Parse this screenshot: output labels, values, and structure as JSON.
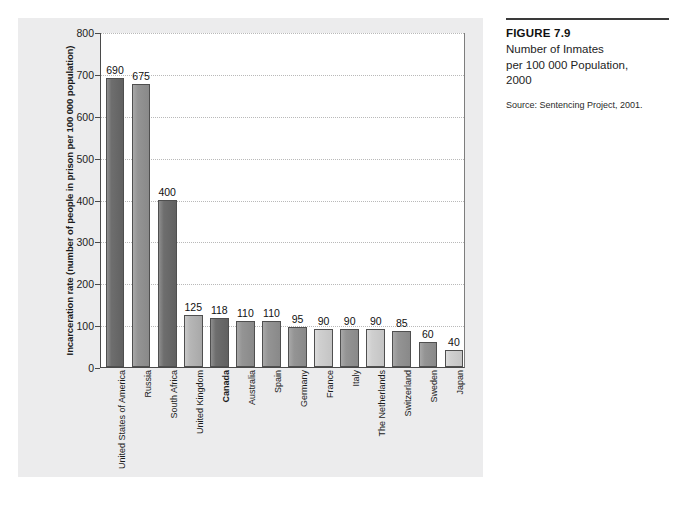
{
  "caption": {
    "figure_number": "FIGURE 7.9",
    "title_line1": "Number of Inmates",
    "title_line2": "per 100 000 Population,",
    "title_line3": "2000",
    "source": "Source: Sentencing Project, 2001."
  },
  "chart_data": {
    "type": "bar",
    "title": "",
    "xlabel": "",
    "ylabel": "Incarceration rate (number of people in prison per 100 000 population)",
    "ylim": [
      0,
      800
    ],
    "yticks": [
      0,
      100,
      200,
      300,
      400,
      500,
      600,
      700,
      800
    ],
    "grid": true,
    "legend": "none",
    "categories": [
      "United States of America",
      "Russia",
      "South Africa",
      "United Kingdom",
      "Canada",
      "Australia",
      "Spain",
      "Germany",
      "France",
      "Italy",
      "The Netherlands",
      "Switzerland",
      "Sweden",
      "Japan"
    ],
    "values": [
      690,
      675,
      400,
      125,
      118,
      110,
      110,
      95,
      90,
      90,
      90,
      85,
      60,
      40
    ],
    "highlight_category": "Canada",
    "bar_shades": [
      "dark",
      "mid",
      "dark",
      "light",
      "dark",
      "mid",
      "mid",
      "mid",
      "verylight",
      "mid",
      "verylight",
      "mid",
      "mid",
      "verylight"
    ]
  },
  "colors": {
    "panel_background": "#ececed",
    "plot_background": "#ffffff",
    "bar_dark": "#6e6e6e",
    "bar_mid": "#949494",
    "bar_light": "#b6b6b6",
    "bar_verylight": "#cfcfcf",
    "bar_outline": "#4f4f4f",
    "gridline": "#b9b9b9",
    "axis": "#4a4a4a",
    "text": "#1b1b1b"
  }
}
